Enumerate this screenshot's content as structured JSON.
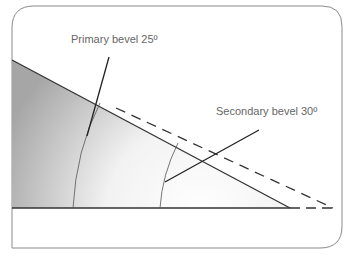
{
  "diagram": {
    "labels": {
      "primary": "Primary bevel 25º",
      "secondary": "Secondary bevel 30º"
    },
    "colors": {
      "frame": "#8a8a8a",
      "line": "#333333",
      "label": "#666666",
      "shade_dark": "#a9a9a9",
      "shade_light": "#ffffff"
    }
  }
}
